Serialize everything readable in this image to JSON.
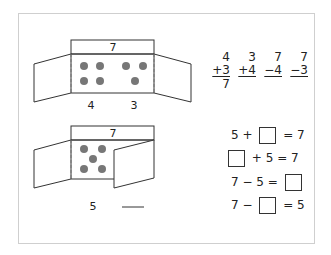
{
  "colors": {
    "frame": "#cfcfcf",
    "dot": "#777777",
    "line": "#333333"
  },
  "figure_top": {
    "total_label": "7",
    "left_count": "4",
    "right_count": "3",
    "left_dots": 4,
    "right_dots": 3
  },
  "figure_bottom": {
    "total_label": "7",
    "known_count": "5",
    "unknown_blank": "",
    "dots": 5
  },
  "vertical_problems": [
    {
      "top": "4",
      "op": "+3",
      "answer": "7"
    },
    {
      "top": "3",
      "op": "+4",
      "answer": ""
    },
    {
      "top": "7",
      "op": "−4",
      "answer": ""
    },
    {
      "top": "7",
      "op": "−3",
      "answer": ""
    }
  ],
  "equations": [
    {
      "before": "5 + ",
      "after": " = 7",
      "box_first": false
    },
    {
      "before": "",
      "after": " + 5 = 7",
      "box_first": true
    },
    {
      "before": "7 − 5 = ",
      "after": "",
      "box_first": false
    },
    {
      "before": "7 − ",
      "after": " = 5",
      "box_first": false
    }
  ]
}
